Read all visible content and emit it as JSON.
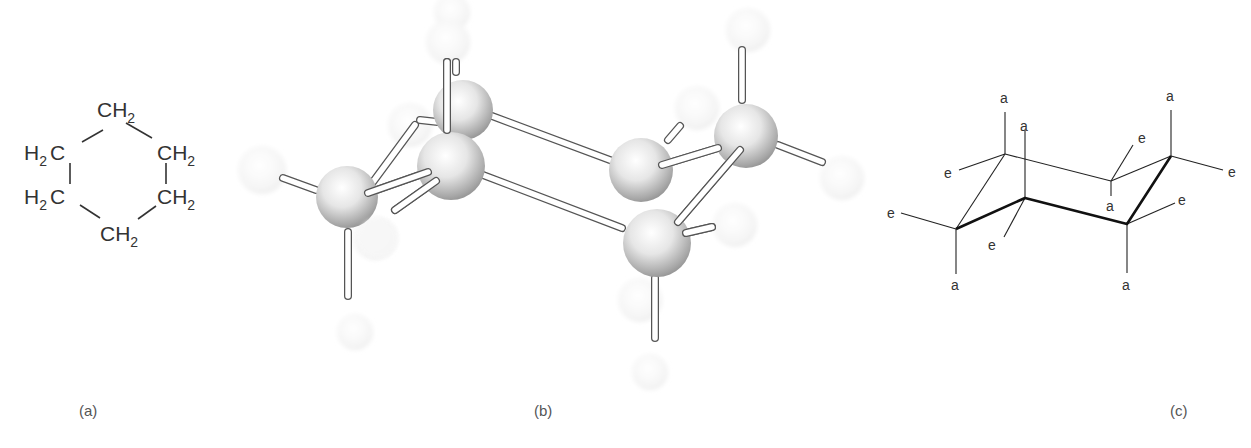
{
  "figure": {
    "panels": [
      {
        "id": "a",
        "caption": "(a)",
        "description": "Cyclohexane structural formula",
        "groups": [
          {
            "text": "CH",
            "sub": "2",
            "position": "top"
          },
          {
            "text": "H",
            "sub": "2",
            "suffix": "C",
            "position": "upper-left"
          },
          {
            "text": "CH",
            "sub": "2",
            "position": "upper-right"
          },
          {
            "text": "H",
            "sub": "2",
            "suffix": "C",
            "position": "lower-left"
          },
          {
            "text": "CH",
            "sub": "2",
            "position": "lower-right"
          },
          {
            "text": "CH",
            "sub": "2",
            "position": "bottom"
          }
        ]
      },
      {
        "id": "b",
        "caption": "(b)",
        "description": "Ball-and-stick model of cyclohexane chair conformation",
        "carbon_color": "#d8d8d8",
        "hydrogen_color": "#f4f4f4"
      },
      {
        "id": "c",
        "caption": "(c)",
        "description": "Chair conformation with axial (a) and equatorial (e) positions",
        "axial_label": "a",
        "equatorial_label": "e"
      }
    ]
  }
}
